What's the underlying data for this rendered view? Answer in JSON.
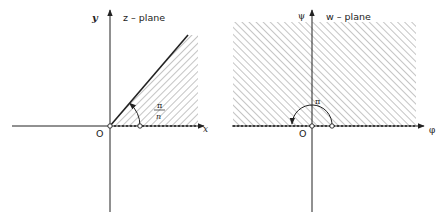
{
  "diagram": {
    "left_panel": {
      "plane_label": "z – plane",
      "x_axis_label": "x",
      "y_axis_label": "y",
      "origin_label": "O",
      "angle_label_numerator": "π",
      "angle_label_denominator": "n",
      "region": "wedge between positive x-axis and ray at angle π/n (hatched)"
    },
    "right_panel": {
      "plane_label": "w – plane",
      "x_axis_label": "φ",
      "y_axis_label": "ψ",
      "origin_label": "O",
      "angle_label": "π",
      "region": "upper half-plane (hatched)"
    },
    "colors": {
      "ink": "#222222",
      "hatch": "#8a8a8a",
      "background": "#ffffff"
    }
  }
}
